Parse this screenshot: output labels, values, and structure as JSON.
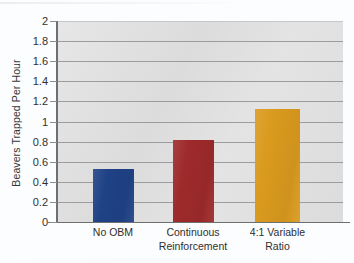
{
  "chart_data": {
    "type": "bar",
    "title": "",
    "subtitle": "",
    "xlabel": "",
    "ylabel": "Beavers Trapped Per Hour",
    "categories": [
      "No OBM",
      "Continuous Reinforcement",
      "4:1 Variable Ratio"
    ],
    "category_lines": [
      [
        "No OBM"
      ],
      [
        "Continuous",
        "Reinforcement"
      ],
      [
        "4:1 Variable",
        "Ratio"
      ]
    ],
    "values": [
      0.53,
      0.82,
      1.12
    ],
    "bar_colors": [
      "#1f4286",
      "#9e2a2b",
      "#da9a1e"
    ],
    "ylim": [
      0,
      2
    ],
    "ytick_labels": [
      "0",
      "0.2",
      "0.4",
      "0.6",
      "0.8",
      "1",
      "1.2",
      "1.4",
      "1.6",
      "1.8",
      "2"
    ],
    "ytick_values": [
      0,
      0.2,
      0.4,
      0.6,
      0.8,
      1,
      1.2,
      1.4,
      1.6,
      1.8,
      2
    ],
    "grid": true,
    "grid_axis": "y",
    "legend": false,
    "legend_position": "none",
    "plot_background": "#dcdcdc",
    "gridline_color": "#9a9c9e",
    "axis_color": "#6e6f71",
    "figure_background": "#fcfdfe"
  },
  "figure": {
    "name": "beavers-trapped-per-hour-bar-chart"
  }
}
